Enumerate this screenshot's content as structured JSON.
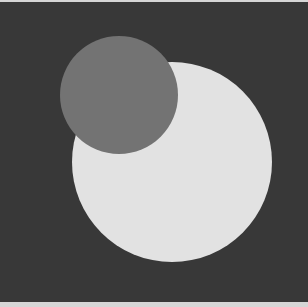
{
  "scene": {
    "background": "#383838",
    "border_color": "#d6d6d6",
    "shapes": [
      {
        "name": "large-circle",
        "cx": 172,
        "cy": 160,
        "r": 100,
        "fill": "#e2e2e2"
      },
      {
        "name": "small-circle",
        "cx": 119,
        "cy": 93,
        "r": 59,
        "fill": "#737373"
      }
    ]
  }
}
